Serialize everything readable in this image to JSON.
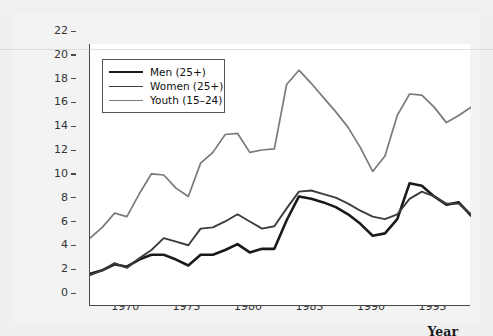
{
  "figure": {
    "background_color": "#efeff0",
    "panel_color": "#ffffff",
    "axis_color": "#4a4a4a"
  },
  "axes": {
    "ytitle_line1": "Unemployment rate",
    "ytitle_line2": "(percent)",
    "xtitle": "Year"
  },
  "legend": {
    "entries": [
      {
        "label": "Men (25+)",
        "color": "#1a1a1a",
        "width": 2.6
      },
      {
        "label": "Women (25+)",
        "color": "#3d3d3d",
        "width": 1.9
      },
      {
        "label": "Youth (15–24)",
        "color": "#7a7a7a",
        "width": 1.7
      }
    ]
  },
  "chart_data": {
    "type": "line",
    "title": "",
    "xlabel": "Year",
    "ylabel": "Unemployment rate (percent)",
    "xlim": [
      1966,
      1997
    ],
    "ylim": [
      0,
      22
    ],
    "yticks": [
      0,
      2,
      4,
      6,
      8,
      10,
      12,
      14,
      16,
      18,
      20,
      22
    ],
    "xticks": [
      1970,
      1975,
      1980,
      1985,
      1990,
      1995
    ],
    "grid": false,
    "legend_position": "upper left",
    "x": [
      1966,
      1967,
      1968,
      1969,
      1970,
      1971,
      1972,
      1973,
      1974,
      1975,
      1976,
      1977,
      1978,
      1979,
      1980,
      1981,
      1982,
      1983,
      1984,
      1985,
      1986,
      1987,
      1988,
      1989,
      1990,
      1991,
      1992,
      1993,
      1994,
      1995,
      1996,
      1997
    ],
    "series": [
      {
        "name": "Men (25+)",
        "color": "#1a1a1a",
        "values": [
          2.7,
          3.0,
          3.5,
          3.3,
          3.9,
          4.3,
          4.3,
          3.9,
          3.4,
          4.3,
          4.3,
          4.7,
          5.2,
          4.5,
          4.8,
          4.8,
          7.2,
          9.2,
          9.0,
          8.7,
          8.3,
          7.7,
          6.9,
          5.9,
          6.1,
          7.3,
          10.3,
          10.1,
          9.2,
          8.5,
          8.7,
          7.6
        ]
      },
      {
        "name": "Women (25+)",
        "color": "#3d3d3d",
        "values": [
          2.6,
          3.0,
          3.6,
          3.2,
          4.0,
          4.7,
          5.7,
          5.4,
          5.1,
          6.5,
          6.6,
          7.1,
          7.7,
          7.1,
          6.5,
          6.7,
          8.2,
          9.6,
          9.7,
          9.4,
          9.1,
          8.6,
          8.0,
          7.5,
          7.3,
          7.7,
          9.0,
          9.6,
          9.2,
          8.6,
          8.6,
          7.7
        ]
      },
      {
        "name": "Youth (15–24)",
        "color": "#7a7a7a",
        "values": [
          5.7,
          6.6,
          7.8,
          7.5,
          9.4,
          11.1,
          11.0,
          9.9,
          9.2,
          12.0,
          12.9,
          14.4,
          14.5,
          12.9,
          13.1,
          13.2,
          18.6,
          19.8,
          18.7,
          17.5,
          16.3,
          15.0,
          13.3,
          11.3,
          12.6,
          16.0,
          17.8,
          17.7,
          16.7,
          15.4,
          16.0,
          16.7
        ]
      }
    ]
  }
}
